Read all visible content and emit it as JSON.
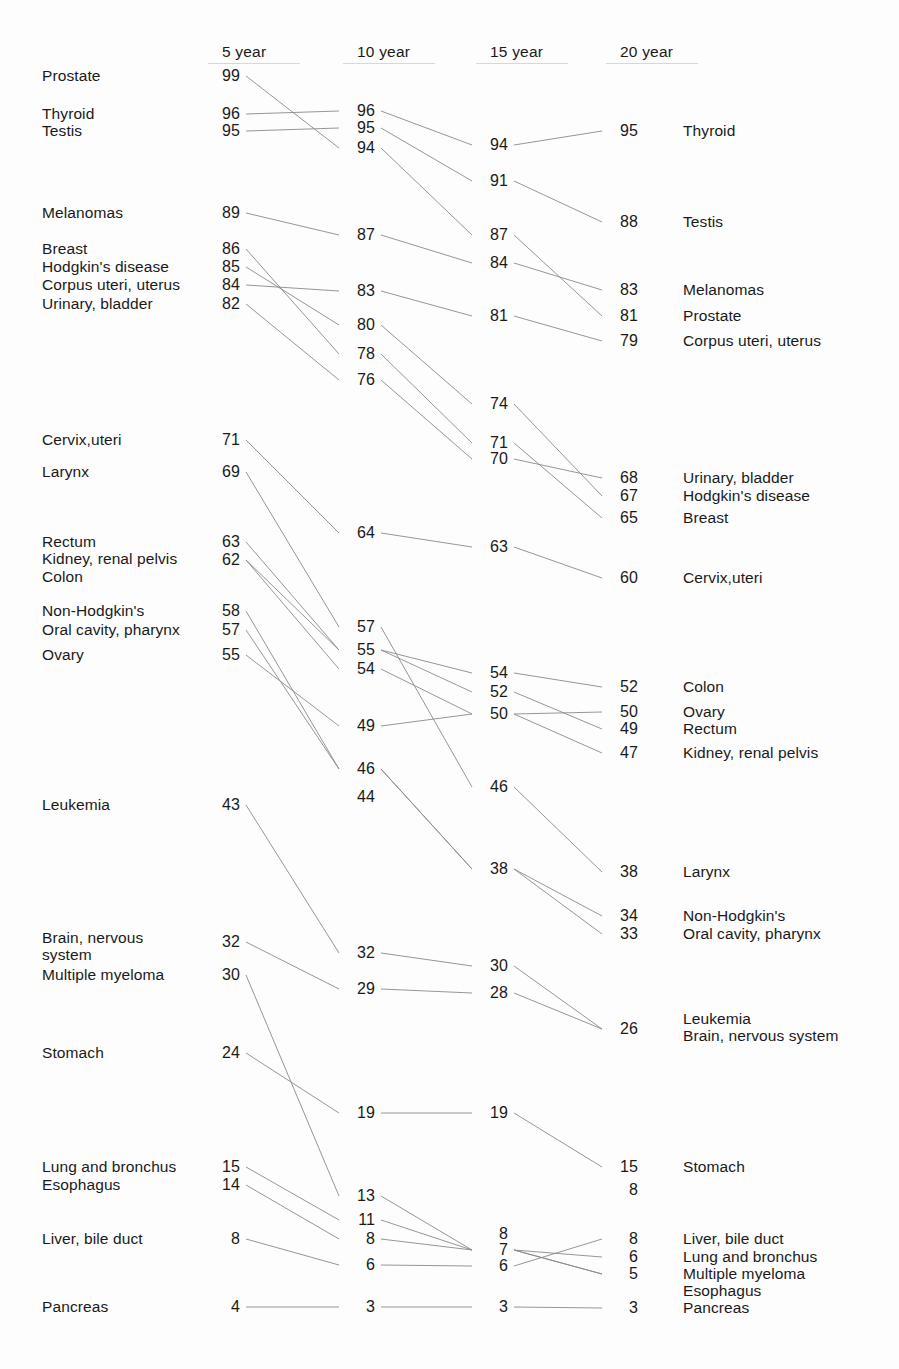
{
  "chart_data": {
    "type": "line",
    "chart_style": "slopegraph",
    "title": "",
    "subtitle": "",
    "xlabel": "",
    "ylabel": "",
    "legend": "none",
    "grid": false,
    "categories": [
      "5 year",
      "10 year",
      "15 year",
      "20 year"
    ],
    "column_headers": [
      {
        "label": "5 year",
        "x": 222
      },
      {
        "label": "10 year",
        "x": 357
      },
      {
        "label": "15 year",
        "x": 490
      },
      {
        "label": "20 year",
        "x": 620
      }
    ],
    "value_axis_note": "Percent survival",
    "series": [
      {
        "name": "Prostate",
        "values": [
          99,
          94,
          87,
          81
        ]
      },
      {
        "name": "Thyroid",
        "values": [
          96,
          96,
          94,
          95
        ]
      },
      {
        "name": "Testis",
        "values": [
          95,
          94,
          91,
          88
        ]
      },
      {
        "name": "Melanomas",
        "values": [
          89,
          87,
          84,
          83
        ]
      },
      {
        "name": "Breast",
        "values": [
          86,
          78,
          71,
          65
        ]
      },
      {
        "name": "Hodgkin's disease",
        "values": [
          85,
          80,
          74,
          67
        ]
      },
      {
        "name": "Corpus uteri, uterus",
        "values": [
          84,
          83,
          81,
          79
        ]
      },
      {
        "name": "Urinary, bladder",
        "values": [
          82,
          76,
          70,
          68
        ]
      },
      {
        "name": "Cervix,uteri",
        "values": [
          71,
          64,
          63,
          60
        ]
      },
      {
        "name": "Larynx",
        "values": [
          69,
          57,
          46,
          38
        ]
      },
      {
        "name": "Rectum",
        "values": [
          63,
          55,
          52,
          49
        ]
      },
      {
        "name": "Kidney, renal pelvis",
        "values": [
          62,
          54,
          50,
          47
        ]
      },
      {
        "name": "Colon",
        "values": [
          62,
          55,
          54,
          52
        ]
      },
      {
        "name": "Non-Hodgkin's",
        "values": [
          58,
          46,
          38,
          34
        ]
      },
      {
        "name": "Oral cavity, pharynx",
        "values": [
          57,
          46,
          38,
          33
        ]
      },
      {
        "name": "Ovary",
        "values": [
          55,
          49,
          50,
          50
        ]
      },
      {
        "name": "Leukemia",
        "values": [
          43,
          32,
          30,
          26
        ]
      },
      {
        "name": "Brain, nervous system",
        "values": [
          32,
          29,
          28,
          26
        ]
      },
      {
        "name": "Multiple myeloma",
        "values": [
          30,
          13,
          7,
          6
        ]
      },
      {
        "name": "Stomach",
        "values": [
          24,
          19,
          19,
          15
        ]
      },
      {
        "name": "Lung and bronchus",
        "values": [
          15,
          11,
          7,
          6
        ]
      },
      {
        "name": "Esophagus",
        "values": [
          14,
          8,
          7,
          5
        ]
      },
      {
        "name": "Liver, bile duct",
        "values": [
          8,
          6,
          8,
          8
        ]
      },
      {
        "name": "Pancreas",
        "values": [
          4,
          3,
          3,
          3
        ]
      }
    ]
  },
  "headers": [
    {
      "label": "5 year"
    },
    {
      "label": "10 year"
    },
    {
      "label": "15 year"
    },
    {
      "label": "20 year"
    }
  ],
  "left_labels": [
    {
      "text": "Prostate",
      "y": 76
    },
    {
      "text": "Thyroid",
      "y": 114
    },
    {
      "text": "Testis",
      "y": 131
    },
    {
      "text": "Melanomas",
      "y": 213
    },
    {
      "text": "Breast",
      "y": 249
    },
    {
      "text": "Hodgkin's disease",
      "y": 267
    },
    {
      "text": "Corpus uteri, uterus",
      "y": 285
    },
    {
      "text": "Urinary, bladder",
      "y": 304
    },
    {
      "text": "Cervix,uteri",
      "y": 440
    },
    {
      "text": "Larynx",
      "y": 472
    },
    {
      "text": "Rectum",
      "y": 542
    },
    {
      "text": "Kidney, renal pelvis",
      "y": 559
    },
    {
      "text": "Colon",
      "y": 577
    },
    {
      "text": "Non-Hodgkin's",
      "y": 611
    },
    {
      "text": "Oral cavity, pharynx",
      "y": 630
    },
    {
      "text": "Ovary",
      "y": 655
    },
    {
      "text": "Leukemia",
      "y": 805
    },
    {
      "text": "Brain, nervous",
      "y": 938
    },
    {
      "text": "system",
      "y": 955
    },
    {
      "text": "Multiple myeloma",
      "y": 975
    },
    {
      "text": "Stomach",
      "y": 1053
    },
    {
      "text": "Lung and bronchus",
      "y": 1167
    },
    {
      "text": "Esophagus",
      "y": 1185
    },
    {
      "text": "Liver, bile duct",
      "y": 1239
    },
    {
      "text": "Pancreas",
      "y": 1307
    }
  ],
  "right_labels": [
    {
      "text": "Thyroid",
      "y": 131
    },
    {
      "text": "Testis",
      "y": 222
    },
    {
      "text": "Melanomas",
      "y": 290
    },
    {
      "text": "Prostate",
      "y": 316
    },
    {
      "text": "Corpus uteri, uterus",
      "y": 341
    },
    {
      "text": "Urinary, bladder",
      "y": 478
    },
    {
      "text": "Hodgkin's disease",
      "y": 496
    },
    {
      "text": "Breast",
      "y": 518
    },
    {
      "text": "Cervix,uteri",
      "y": 578
    },
    {
      "text": "Colon",
      "y": 687
    },
    {
      "text": "Ovary",
      "y": 712
    },
    {
      "text": "Rectum",
      "y": 729
    },
    {
      "text": "Kidney, renal pelvis",
      "y": 753
    },
    {
      "text": "Larynx",
      "y": 872
    },
    {
      "text": "Non-Hodgkin's",
      "y": 916
    },
    {
      "text": "Oral cavity, pharynx",
      "y": 934
    },
    {
      "text": "Leukemia",
      "y": 1019
    },
    {
      "text": "Brain, nervous system",
      "y": 1036
    },
    {
      "text": "Stomach",
      "y": 1167
    },
    {
      "text": "Liver, bile duct",
      "y": 1239
    },
    {
      "text": "Lung and bronchus",
      "y": 1257
    },
    {
      "text": "Multiple myeloma",
      "y": 1274
    },
    {
      "text": "Esophagus",
      "y": 1291
    },
    {
      "text": "Pancreas",
      "y": 1308
    }
  ],
  "values_col1": [
    {
      "v": "99",
      "y": 76
    },
    {
      "v": "96",
      "y": 114
    },
    {
      "v": "95",
      "y": 131
    },
    {
      "v": "89",
      "y": 213
    },
    {
      "v": "86",
      "y": 249
    },
    {
      "v": "85",
      "y": 267
    },
    {
      "v": "84",
      "y": 285
    },
    {
      "v": "82",
      "y": 304
    },
    {
      "v": "71",
      "y": 440
    },
    {
      "v": "69",
      "y": 472
    },
    {
      "v": "63",
      "y": 542
    },
    {
      "v": "62",
      "y": 560
    },
    {
      "v": "58",
      "y": 611
    },
    {
      "v": "57",
      "y": 630
    },
    {
      "v": "55",
      "y": 655
    },
    {
      "v": "43",
      "y": 805
    },
    {
      "v": "32",
      "y": 942
    },
    {
      "v": "30",
      "y": 975
    },
    {
      "v": "24",
      "y": 1053
    },
    {
      "v": "15",
      "y": 1167
    },
    {
      "v": "14",
      "y": 1185
    },
    {
      "v": "8",
      "y": 1239
    },
    {
      "v": "4",
      "y": 1307
    }
  ],
  "values_col2": [
    {
      "v": "96",
      "y": 111
    },
    {
      "v": "95",
      "y": 128
    },
    {
      "v": "94",
      "y": 148
    },
    {
      "v": "87",
      "y": 235
    },
    {
      "v": "83",
      "y": 291
    },
    {
      "v": "80",
      "y": 325
    },
    {
      "v": "78",
      "y": 354
    },
    {
      "v": "76",
      "y": 380
    },
    {
      "v": "64",
      "y": 533
    },
    {
      "v": "57",
      "y": 627
    },
    {
      "v": "55",
      "y": 650
    },
    {
      "v": "54",
      "y": 669
    },
    {
      "v": "49",
      "y": 726
    },
    {
      "v": "46",
      "y": 769
    },
    {
      "v": "44",
      "y": 797
    },
    {
      "v": "32",
      "y": 953
    },
    {
      "v": "29",
      "y": 989
    },
    {
      "v": "19",
      "y": 1113
    },
    {
      "v": "13",
      "y": 1196
    },
    {
      "v": "11",
      "y": 1220
    },
    {
      "v": "8",
      "y": 1239
    },
    {
      "v": "6",
      "y": 1265
    },
    {
      "v": "3",
      "y": 1307
    }
  ],
  "values_col3": [
    {
      "v": "94",
      "y": 145
    },
    {
      "v": "91",
      "y": 181
    },
    {
      "v": "87",
      "y": 235
    },
    {
      "v": "84",
      "y": 263
    },
    {
      "v": "81",
      "y": 316
    },
    {
      "v": "74",
      "y": 404
    },
    {
      "v": "71",
      "y": 443
    },
    {
      "v": "70",
      "y": 459
    },
    {
      "v": "63",
      "y": 547
    },
    {
      "v": "54",
      "y": 673
    },
    {
      "v": "52",
      "y": 692
    },
    {
      "v": "50",
      "y": 714
    },
    {
      "v": "46",
      "y": 787
    },
    {
      "v": "38",
      "y": 869
    },
    {
      "v": "30",
      "y": 966
    },
    {
      "v": "28",
      "y": 993
    },
    {
      "v": "19",
      "y": 1113
    },
    {
      "v": "8",
      "y": 1234
    },
    {
      "v": "7",
      "y": 1250
    },
    {
      "v": "6",
      "y": 1266
    },
    {
      "v": "3",
      "y": 1307
    }
  ],
  "values_col4": [
    {
      "v": "95",
      "y": 131
    },
    {
      "v": "88",
      "y": 222
    },
    {
      "v": "83",
      "y": 290
    },
    {
      "v": "81",
      "y": 316
    },
    {
      "v": "79",
      "y": 341
    },
    {
      "v": "68",
      "y": 478
    },
    {
      "v": "67",
      "y": 496
    },
    {
      "v": "65",
      "y": 518
    },
    {
      "v": "60",
      "y": 578
    },
    {
      "v": "52",
      "y": 687
    },
    {
      "v": "50",
      "y": 712
    },
    {
      "v": "49",
      "y": 729
    },
    {
      "v": "47",
      "y": 753
    },
    {
      "v": "38",
      "y": 872
    },
    {
      "v": "34",
      "y": 916
    },
    {
      "v": "33",
      "y": 934
    },
    {
      "v": "26",
      "y": 1029
    },
    {
      "v": "15",
      "y": 1167
    },
    {
      "v": "8",
      "y": 1190
    },
    {
      "v": "8",
      "y": 1239
    },
    {
      "v": "6",
      "y": 1257
    },
    {
      "v": "5",
      "y": 1274
    },
    {
      "v": "3",
      "y": 1308
    }
  ],
  "connections": [
    {
      "name": "prostate",
      "pts": [
        [
          76,
          148
        ],
        [
          148,
          235
        ],
        [
          235,
          316
        ]
      ]
    },
    {
      "name": "thyroid",
      "pts": [
        [
          114,
          111
        ],
        [
          111,
          145
        ],
        [
          145,
          131
        ]
      ]
    },
    {
      "name": "testis",
      "pts": [
        [
          131,
          128
        ],
        [
          128,
          181
        ],
        [
          181,
          222
        ]
      ]
    },
    {
      "name": "melanomas",
      "pts": [
        [
          213,
          235
        ],
        [
          235,
          263
        ],
        [
          263,
          290
        ]
      ]
    },
    {
      "name": "breast",
      "pts": [
        [
          249,
          354
        ],
        [
          354,
          443
        ],
        [
          443,
          518
        ]
      ]
    },
    {
      "name": "hodgkins",
      "pts": [
        [
          267,
          325
        ],
        [
          325,
          404
        ],
        [
          404,
          496
        ]
      ]
    },
    {
      "name": "corpus",
      "pts": [
        [
          285,
          291
        ],
        [
          291,
          316
        ],
        [
          316,
          341
        ]
      ]
    },
    {
      "name": "bladder",
      "pts": [
        [
          304,
          380
        ],
        [
          380,
          459
        ],
        [
          459,
          478
        ]
      ]
    },
    {
      "name": "cervix",
      "pts": [
        [
          440,
          533
        ],
        [
          533,
          547
        ],
        [
          547,
          578
        ]
      ]
    },
    {
      "name": "larynx",
      "pts": [
        [
          472,
          627
        ],
        [
          627,
          787
        ],
        [
          787,
          872
        ]
      ]
    },
    {
      "name": "rectum",
      "pts": [
        [
          542,
          650
        ],
        [
          650,
          692
        ],
        [
          692,
          729
        ]
      ]
    },
    {
      "name": "kidney",
      "pts": [
        [
          560,
          669
        ],
        [
          669,
          714
        ],
        [
          714,
          753
        ]
      ]
    },
    {
      "name": "colon",
      "pts": [
        [
          560,
          650
        ],
        [
          650,
          673
        ],
        [
          673,
          687
        ]
      ]
    },
    {
      "name": "nonhodgkins",
      "pts": [
        [
          611,
          769
        ],
        [
          769,
          869
        ],
        [
          869,
          916
        ]
      ]
    },
    {
      "name": "oralcavity",
      "pts": [
        [
          630,
          769
        ],
        [
          769,
          869
        ],
        [
          869,
          934
        ]
      ]
    },
    {
      "name": "ovary",
      "pts": [
        [
          655,
          726
        ],
        [
          726,
          714
        ],
        [
          714,
          712
        ]
      ]
    },
    {
      "name": "leukemia",
      "pts": [
        [
          805,
          953
        ],
        [
          953,
          966
        ],
        [
          966,
          1029
        ]
      ]
    },
    {
      "name": "brain",
      "pts": [
        [
          942,
          989
        ],
        [
          989,
          993
        ],
        [
          993,
          1029
        ]
      ]
    },
    {
      "name": "myeloma",
      "pts": [
        [
          975,
          1196
        ],
        [
          1196,
          1250
        ],
        [
          1250,
          1257
        ]
      ]
    },
    {
      "name": "stomach",
      "pts": [
        [
          1053,
          1113
        ],
        [
          1113,
          1113
        ],
        [
          1113,
          1167
        ]
      ]
    },
    {
      "name": "lung",
      "pts": [
        [
          1167,
          1220
        ],
        [
          1220,
          1250
        ],
        [
          1250,
          1274
        ]
      ]
    },
    {
      "name": "esophagus",
      "pts": [
        [
          1185,
          1239
        ],
        [
          1239,
          1250
        ],
        [
          1250,
          1274
        ]
      ]
    },
    {
      "name": "liver",
      "pts": [
        [
          1239,
          1265
        ],
        [
          1265,
          1266
        ],
        [
          1266,
          1239
        ]
      ]
    },
    {
      "name": "pancreas",
      "pts": [
        [
          1307,
          1307
        ],
        [
          1307,
          1307
        ],
        [
          1307,
          1308
        ]
      ]
    }
  ],
  "geometry": {
    "col_value_right_x": [
      240,
      375,
      508,
      638
    ],
    "col_line_start_x": [
      246,
      381,
      514,
      644
    ],
    "col_line_end_x": [
      351,
      484,
      614,
      644
    ],
    "left_label_x": 42,
    "right_label_x": 683,
    "header_y": 44
  },
  "colors": {
    "background": "#fdfdfd",
    "text": "#1a1a1a",
    "line": "#8a8a8a",
    "rule": "#d8d8d8"
  }
}
